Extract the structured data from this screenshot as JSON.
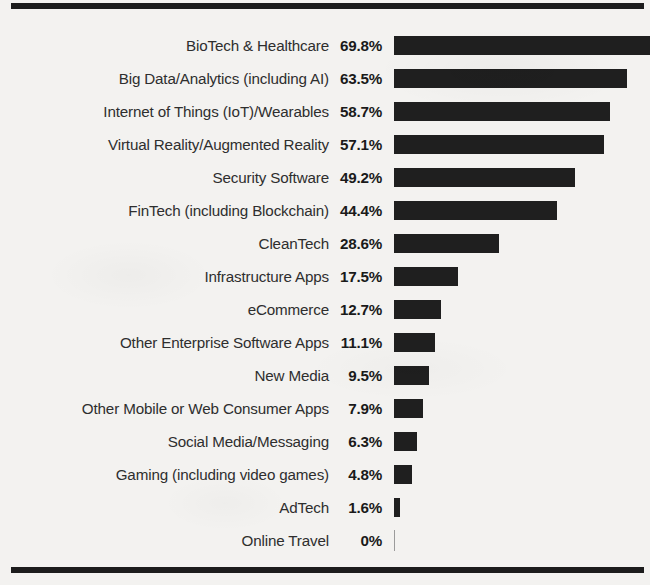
{
  "chart_data": {
    "type": "bar",
    "orientation": "horizontal",
    "title": "",
    "subtitle": "",
    "xlabel": "",
    "ylabel": "",
    "xlim": [
      0,
      70
    ],
    "grid": false,
    "legend": null,
    "value_suffix": "%",
    "categories": [
      "BioTech & Healthcare",
      "Big Data/Analytics (including AI)",
      "Internet of Things (IoT)/Wearables",
      "Virtual Reality/Augmented Reality",
      "Security Software",
      "FinTech (including Blockchain)",
      "CleanTech",
      "Infrastructure Apps",
      "eCommerce",
      "Other Enterprise Software Apps",
      "New Media",
      "Other Mobile or Web Consumer Apps",
      "Social Media/Messaging",
      "Gaming (including video games)",
      "AdTech",
      "Online Travel"
    ],
    "values": [
      69.8,
      63.5,
      58.7,
      57.1,
      49.2,
      44.4,
      28.6,
      17.5,
      12.7,
      11.1,
      9.5,
      7.9,
      6.3,
      4.8,
      1.6,
      0
    ],
    "value_labels": [
      "69.8%",
      "63.5%",
      "58.7%",
      "57.1%",
      "49.2%",
      "44.4%",
      "28.6%",
      "17.5%",
      "12.7%",
      "11.1%",
      "9.5%",
      "7.9%",
      "6.3%",
      "4.8%",
      "1.6%",
      "0%"
    ],
    "bar_color": "#1f1f1f",
    "background_color": "#f3f2f0",
    "label_color": "#2e2e2e",
    "rule_color": "#1c1c1c"
  },
  "decorations": {
    "top_rule": "horizontal-rule-top",
    "bottom_rule": "horizontal-rule-bottom"
  }
}
